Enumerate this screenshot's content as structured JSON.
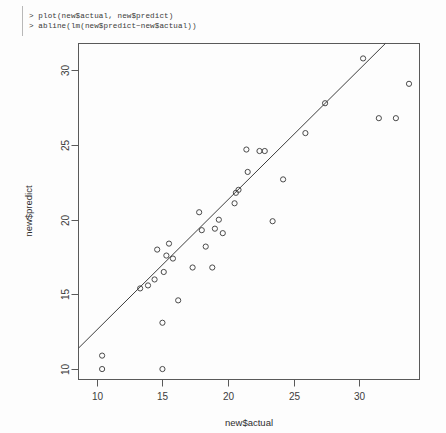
{
  "console": {
    "prompt": ">",
    "lines": [
      "> plot(new$actual, new$predict)",
      "> abline(lm(new$predict~new$actual))"
    ],
    "line1": "> plot(new$actual, new$predict)",
    "line2": "> abline(lm(new$predict~new$actual))"
  },
  "colors": {
    "background": "#fdfdfd",
    "frame": "#595959",
    "point": "#4a4a4a",
    "line": "#3d3d3d",
    "text": "#3c3c3c"
  },
  "chart_data": {
    "type": "scatter",
    "title": "",
    "xlabel": "new$actual",
    "ylabel": "new$predict",
    "xlim": [
      8.6,
      34.6
    ],
    "ylim": [
      9.3,
      31.8
    ],
    "xticks": [
      10,
      15,
      20,
      25,
      30
    ],
    "yticks": [
      10,
      15,
      20,
      25,
      30
    ],
    "xtick_labels": [
      "10",
      "15",
      "20",
      "25",
      "30"
    ],
    "ytick_labels": [
      "10",
      "15",
      "20",
      "25",
      "30"
    ],
    "grid": false,
    "legend": false,
    "point_symbol": "open-circle",
    "points": [
      {
        "x": 10.4,
        "y": 10.9
      },
      {
        "x": 10.4,
        "y": 10.0
      },
      {
        "x": 13.3,
        "y": 15.4
      },
      {
        "x": 13.9,
        "y": 15.6
      },
      {
        "x": 14.4,
        "y": 16.0
      },
      {
        "x": 14.6,
        "y": 18.0
      },
      {
        "x": 15.0,
        "y": 10.0
      },
      {
        "x": 15.0,
        "y": 13.1
      },
      {
        "x": 15.1,
        "y": 16.5
      },
      {
        "x": 15.3,
        "y": 17.6
      },
      {
        "x": 15.5,
        "y": 18.4
      },
      {
        "x": 15.8,
        "y": 17.4
      },
      {
        "x": 16.2,
        "y": 14.6
      },
      {
        "x": 17.3,
        "y": 16.8
      },
      {
        "x": 17.8,
        "y": 20.5
      },
      {
        "x": 18.0,
        "y": 19.3
      },
      {
        "x": 18.3,
        "y": 18.2
      },
      {
        "x": 18.8,
        "y": 16.8
      },
      {
        "x": 19.0,
        "y": 19.4
      },
      {
        "x": 19.3,
        "y": 20.0
      },
      {
        "x": 19.6,
        "y": 19.1
      },
      {
        "x": 20.5,
        "y": 21.1
      },
      {
        "x": 20.6,
        "y": 21.8
      },
      {
        "x": 20.8,
        "y": 22.0
      },
      {
        "x": 21.4,
        "y": 24.7
      },
      {
        "x": 21.5,
        "y": 23.2
      },
      {
        "x": 22.4,
        "y": 24.6
      },
      {
        "x": 22.8,
        "y": 24.6
      },
      {
        "x": 23.4,
        "y": 19.9
      },
      {
        "x": 24.2,
        "y": 22.7
      },
      {
        "x": 25.9,
        "y": 25.8
      },
      {
        "x": 27.4,
        "y": 27.8
      },
      {
        "x": 30.3,
        "y": 30.8
      },
      {
        "x": 31.5,
        "y": 26.8
      },
      {
        "x": 32.8,
        "y": 26.8
      },
      {
        "x": 33.8,
        "y": 29.1
      }
    ],
    "fit_line": {
      "label": "lm(new$predict ~ new$actual)",
      "x_start": 8.6,
      "y_start": 11.4,
      "x_end": 32.0,
      "y_end": 31.8,
      "slope": 0.872,
      "intercept": 3.9
    }
  }
}
